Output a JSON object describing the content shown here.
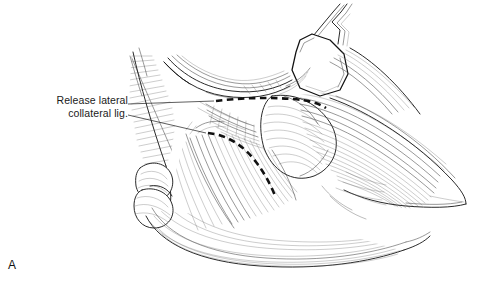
{
  "figure": {
    "letter": "A",
    "domain_type": "medical-surgical-illustration",
    "style": "pen-and-ink line drawing, black on white",
    "background_color": "#ffffff",
    "ink_color": "#1a1a1a",
    "hatch_color": "#555555",
    "width_px": 497,
    "height_px": 292
  },
  "annotation": {
    "label_line_1": "Release lateral",
    "label_line_2": "collateral lig.",
    "label_full": "Release lateral collateral lig.",
    "text_color": "#1a1a1a",
    "alignment": "right",
    "leader_count": 2
  },
  "cut_lines": {
    "name": "release-incision-dashed-lines",
    "color": "#111111",
    "style": "bold dashed",
    "count": 2,
    "upper_description": "horizontal dashed cut across proximal capsule",
    "lower_description": "curved dashed cut sweeping inferolaterally"
  },
  "anatomy": {
    "view": "lateral elbow, surgical exposure",
    "structures": [
      "distal humerus condyle",
      "radial head",
      "olecranon / proximal ulna",
      "lateral collateral ligament",
      "common extensor tendon fibers",
      "retracted soft tissue flap",
      "joint capsule"
    ]
  },
  "instrument": {
    "name": "retractor",
    "location": "upper right",
    "blade_fill": "#ffffff",
    "outline_color": "#111111"
  }
}
